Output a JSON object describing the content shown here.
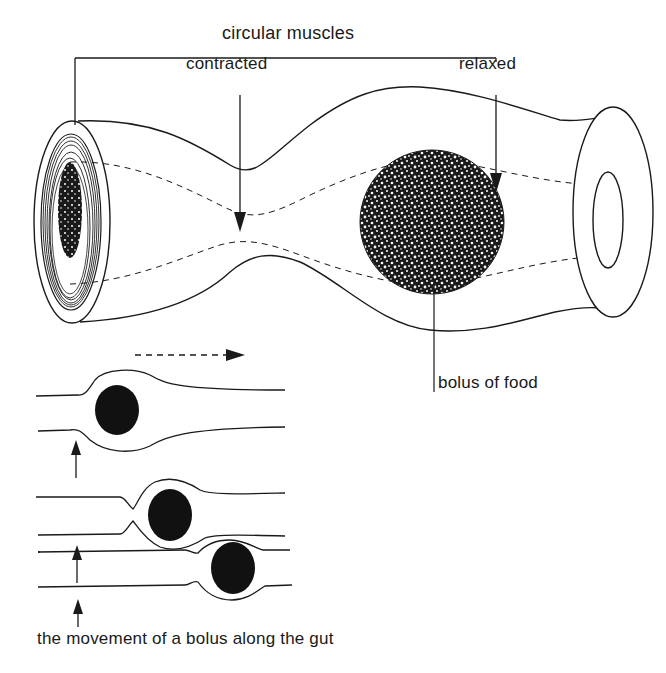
{
  "figure": {
    "labels": {
      "muscle_group": "circular muscles",
      "contracted": "contracted",
      "relaxed": "relaxed",
      "bolus": "bolus of food",
      "caption": "the movement of a bolus along the gut"
    },
    "colors": {
      "background": "#ffffff",
      "ink": "#1a1a1a",
      "bolus_fill": "#111111"
    },
    "sequence": {
      "panels": 3,
      "direction": "left-to-right",
      "stages": [
        {
          "step": 1,
          "bolus_position": "left",
          "constriction": "behind bolus"
        },
        {
          "step": 2,
          "bolus_position": "middle",
          "constriction": "behind bolus"
        },
        {
          "step": 3,
          "bolus_position": "right",
          "constriction": "behind bolus"
        }
      ]
    }
  }
}
